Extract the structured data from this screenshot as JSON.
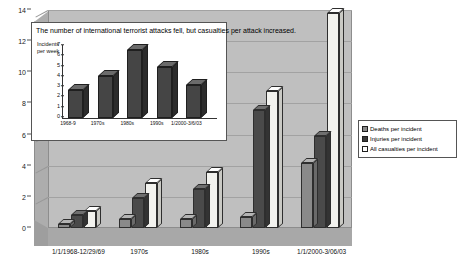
{
  "chart_data": {
    "type": "bar",
    "title": "The number of international terrorist attacks  fell,  but casualties per attack increased.",
    "xlabel": "",
    "ylabel": "",
    "ylim": [
      0,
      14
    ],
    "yticks": [
      0,
      2,
      4,
      6,
      8,
      10,
      12,
      14
    ],
    "grid": true,
    "legend_position": "right",
    "categories": [
      "1/1/1968-12/29/69",
      "1970s",
      "1980s",
      "1990s",
      "1/1/2000-3/06/03"
    ],
    "series": [
      {
        "name": "Deaths per incident",
        "values": [
          0.25,
          0.55,
          0.55,
          0.7,
          4.2
        ],
        "color": "#8a8a8a"
      },
      {
        "name": "Injuries per incident",
        "values": [
          0.85,
          1.9,
          2.5,
          7.6,
          5.9
        ],
        "color": "#3a3a3a"
      },
      {
        "name": "All casualties per incident",
        "values": [
          1.1,
          2.9,
          3.6,
          8.8,
          13.8
        ],
        "color": "#fbfbfb"
      }
    ],
    "inset": {
      "type": "bar",
      "ylabel": "Incidents\nper week",
      "ylim": [
        0,
        7
      ],
      "yticks": [
        0,
        1,
        2,
        3,
        4,
        5,
        6,
        7
      ],
      "categories": [
        "1968-9",
        "1970s",
        "1980s",
        "1990s",
        "1/2000-3/6/03"
      ],
      "values": [
        2.7,
        4.1,
        6.6,
        5.0,
        3.2
      ],
      "color": "#454545"
    }
  },
  "legend": {
    "items": [
      {
        "label": "Deaths per incident"
      },
      {
        "label": "Injuries per incident"
      },
      {
        "label": "All casualties per incident"
      }
    ]
  }
}
